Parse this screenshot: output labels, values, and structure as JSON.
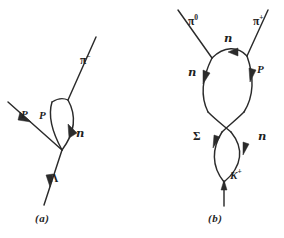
{
  "figure": {
    "type": "particle-interaction-diagrams",
    "background_color": "#ffffff",
    "ink_color": "#2b2b2b",
    "width": 284,
    "height": 238,
    "panels": [
      {
        "id": "panel-a",
        "caption": "(a)",
        "description": "Lambda entering from below, vertex producing a proton, a proton-neutron loop and an outgoing negative pion",
        "labels": [
          {
            "key": "pi_minus",
            "base": "π",
            "sup": "−",
            "style": "greek",
            "x": 80,
            "y": 59
          },
          {
            "key": "proton_in",
            "base": "P",
            "sup": "",
            "style": "particle",
            "x": 21,
            "y": 113
          },
          {
            "key": "proton_loop",
            "base": "P",
            "sup": "",
            "style": "particle",
            "x": 39,
            "y": 114
          },
          {
            "key": "neutron_loop",
            "base": "n",
            "sup": "",
            "style": "script",
            "x": 73,
            "y": 131
          },
          {
            "key": "lambda_in",
            "base": "Λ",
            "sup": "",
            "style": "greek",
            "x": 46,
            "y": 176
          }
        ]
      },
      {
        "id": "panel-b",
        "caption": "(b)",
        "description": "K-plus entering from below, sigma-neutron loop, crossing lines, neutron-proton loop, outgoing neutral and positive pions",
        "labels": [
          {
            "key": "pi_zero",
            "base": "π",
            "sup": "0",
            "style": "greek",
            "x": 189,
            "y": 12
          },
          {
            "key": "pi_plus",
            "base": "π",
            "sup": "+",
            "style": "greek",
            "x": 254,
            "y": 12
          },
          {
            "key": "neutron_top",
            "base": "n",
            "sup": "",
            "style": "script",
            "x": 224,
            "y": 36
          },
          {
            "key": "neutron_left",
            "base": "n",
            "sup": "",
            "style": "script",
            "x": 190,
            "y": 68
          },
          {
            "key": "proton_right",
            "base": "P",
            "sup": "",
            "style": "particle",
            "x": 255,
            "y": 66
          },
          {
            "key": "sigma_left",
            "base": "Σ",
            "sup": "",
            "style": "greek",
            "x": 193,
            "y": 133
          },
          {
            "key": "neutron_right",
            "base": "n",
            "sup": "",
            "style": "script",
            "x": 256,
            "y": 133
          },
          {
            "key": "k_plus",
            "base": "K",
            "sup": "+",
            "style": "particle",
            "x": 236,
            "y": 172
          }
        ]
      }
    ]
  }
}
